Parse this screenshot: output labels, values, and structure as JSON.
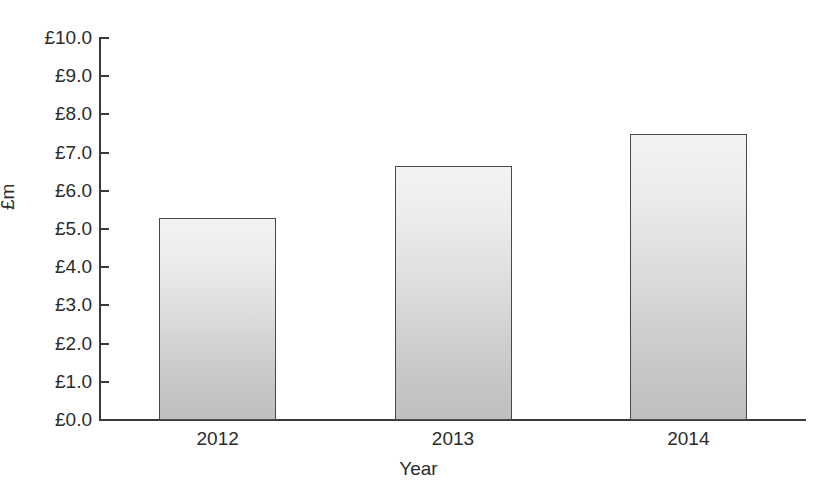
{
  "chart_data": {
    "type": "bar",
    "title": "",
    "subtitle": "",
    "xlabel": "Year",
    "ylabel": "£m",
    "categories": [
      "2012",
      "2013",
      "2014"
    ],
    "values": [
      5.3,
      6.65,
      7.5
    ],
    "series": [
      {
        "name": "",
        "values": [
          5.3,
          6.65,
          7.5
        ]
      }
    ],
    "ylim": [
      0,
      10
    ],
    "ytick_values": [
      0,
      1,
      2,
      3,
      4,
      5,
      6,
      7,
      8,
      9,
      10
    ],
    "ytick_labels": [
      "£0.0",
      "£1.0",
      "£2.0",
      "£3.0",
      "£4.0",
      "£5.0",
      "£6.0",
      "£7.0",
      "£8.0",
      "£9.0",
      "£10.0"
    ],
    "xtick_labels": [
      "2012",
      "2013",
      "2014"
    ],
    "grid": false,
    "legend": false,
    "legend_position": "none",
    "annotations": [],
    "bar_fill_top_color": "#f3f3f3",
    "bar_fill_bottom_color": "#bfbfbf",
    "bar_border_color": "#4a4a4a",
    "axis_color": "#3a3a3a",
    "text_color": "#2b2b2b",
    "background_color": "#ffffff"
  }
}
